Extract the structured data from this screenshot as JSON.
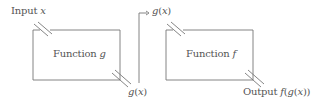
{
  "diagram": {
    "type": "function composition",
    "labels": {
      "input": "Input x",
      "function_g": "Function g",
      "g_output": "g(x)",
      "g_to_f": "g(x)",
      "function_f": "Function f",
      "output": "Output f(g(x))"
    },
    "nodes": [
      {
        "id": "g",
        "label": "Function g"
      },
      {
        "id": "f",
        "label": "Function f"
      }
    ],
    "edges": [
      {
        "from": "input",
        "to": "g",
        "label": "Input x"
      },
      {
        "from": "g",
        "to": "f",
        "label": "g(x)"
      },
      {
        "from": "f",
        "to": "output",
        "label": "Output f(g(x))"
      }
    ],
    "colors": {
      "line": "#777777",
      "text": "#555555",
      "background": "#ffffff"
    }
  }
}
